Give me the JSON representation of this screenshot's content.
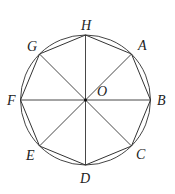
{
  "diagram": {
    "center": {
      "label": "O",
      "x": 85.5,
      "y": 100
    },
    "radius": 65,
    "stroke_color": "#333333",
    "vertices": [
      {
        "label": "A",
        "x": 131.5,
        "y": 54,
        "lx": 138,
        "ly": 50
      },
      {
        "label": "B",
        "x": 150.5,
        "y": 100,
        "lx": 157,
        "ly": 105
      },
      {
        "label": "C",
        "x": 131.5,
        "y": 146,
        "lx": 136,
        "ly": 159
      },
      {
        "label": "D",
        "x": 85.5,
        "y": 165,
        "lx": 80,
        "ly": 183
      },
      {
        "label": "E",
        "x": 39.5,
        "y": 146,
        "lx": 26,
        "ly": 160
      },
      {
        "label": "F",
        "x": 20.5,
        "y": 100,
        "lx": 7,
        "ly": 105
      },
      {
        "label": "G",
        "x": 39.5,
        "y": 54,
        "lx": 27,
        "ly": 51
      },
      {
        "label": "H",
        "x": 85.5,
        "y": 35,
        "lx": 81,
        "ly": 30
      }
    ],
    "center_label_pos": {
      "lx": 97,
      "ly": 96
    }
  }
}
